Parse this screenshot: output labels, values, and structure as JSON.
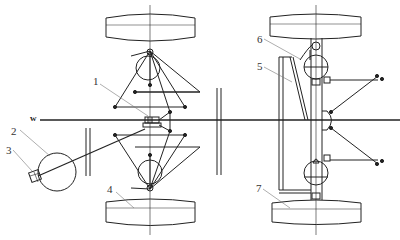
{
  "diagram": {
    "type": "mechanical-schematic",
    "axis_label": "w",
    "callouts": [
      {
        "id": "1",
        "text": "1"
      },
      {
        "id": "2",
        "text": "2"
      },
      {
        "id": "3",
        "text": "3"
      },
      {
        "id": "4",
        "text": "4"
      },
      {
        "id": "5",
        "text": "5"
      },
      {
        "id": "6",
        "text": "6"
      },
      {
        "id": "7",
        "text": "7"
      }
    ],
    "colors": {
      "line": "#222222",
      "background": "#ffffff",
      "leader": "#777777"
    }
  }
}
